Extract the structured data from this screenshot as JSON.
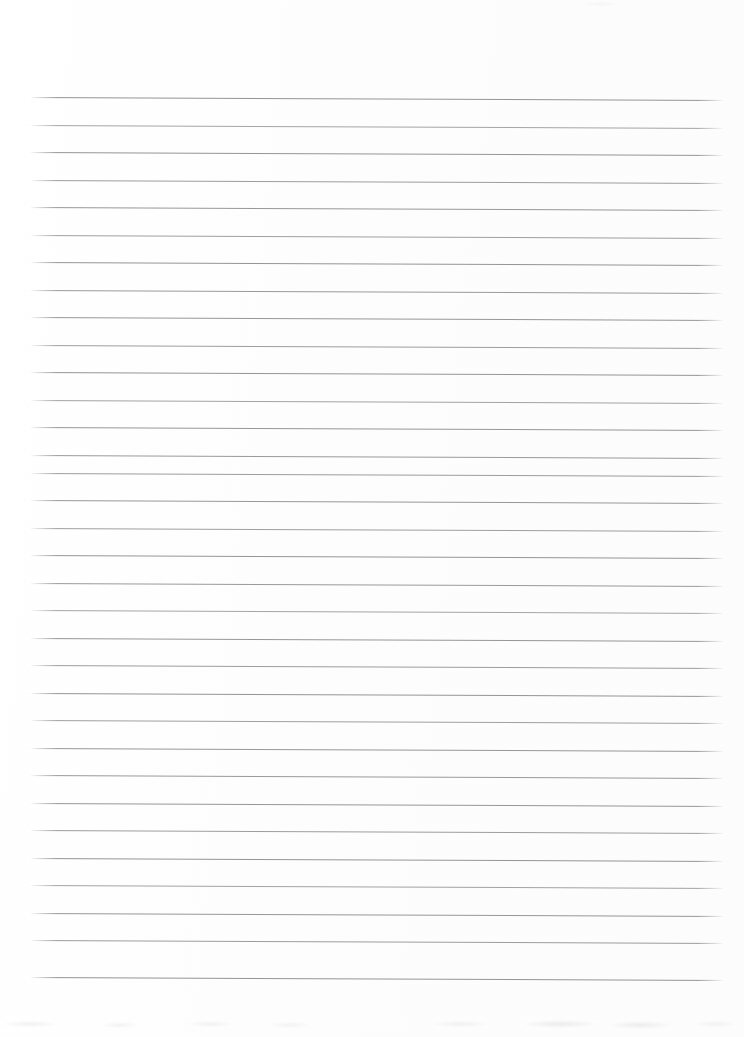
{
  "document": {
    "kind": "scanned-blank-ruled-page",
    "description": "Blank lined notebook paper scan with no handwriting or printed text",
    "page_width": 744,
    "page_height": 1037,
    "background_color": "#fdfdfd",
    "text_content": "",
    "visible_text": []
  },
  "ruling": {
    "line_color": "#8f8f8f",
    "line_thickness_px": 1,
    "line_count": 33,
    "first_line_y": 97,
    "line_spacing_px": 27.5,
    "left_x": 31,
    "right_x": 723,
    "tilt_px_over_page": 3,
    "lines": [
      {
        "y": 97,
        "x1": 31,
        "x2": 723,
        "opacity": 0.95
      },
      {
        "y": 125,
        "x1": 31,
        "x2": 723,
        "opacity": 0.8
      },
      {
        "y": 152,
        "x1": 31,
        "x2": 723,
        "opacity": 0.95
      },
      {
        "y": 180,
        "x1": 31,
        "x2": 723,
        "opacity": 0.88
      },
      {
        "y": 207,
        "x1": 31,
        "x2": 723,
        "opacity": 0.92
      },
      {
        "y": 235,
        "x1": 31,
        "x2": 723,
        "opacity": 0.85
      },
      {
        "y": 262,
        "x1": 31,
        "x2": 723,
        "opacity": 0.95
      },
      {
        "y": 290,
        "x1": 31,
        "x2": 723,
        "opacity": 0.9
      },
      {
        "y": 317,
        "x1": 31,
        "x2": 723,
        "opacity": 0.93
      },
      {
        "y": 345,
        "x1": 31,
        "x2": 723,
        "opacity": 0.87
      },
      {
        "y": 372,
        "x1": 31,
        "x2": 723,
        "opacity": 0.95
      },
      {
        "y": 400,
        "x1": 31,
        "x2": 723,
        "opacity": 0.82
      },
      {
        "y": 427,
        "x1": 31,
        "x2": 723,
        "opacity": 0.93
      },
      {
        "y": 455,
        "x1": 31,
        "x2": 723,
        "opacity": 0.9
      },
      {
        "y": 473,
        "x1": 31,
        "x2": 723,
        "opacity": 0.88
      },
      {
        "y": 500,
        "x1": 31,
        "x2": 723,
        "opacity": 0.92
      },
      {
        "y": 528,
        "x1": 31,
        "x2": 723,
        "opacity": 0.86
      },
      {
        "y": 555,
        "x1": 31,
        "x2": 723,
        "opacity": 0.94
      },
      {
        "y": 583,
        "x1": 31,
        "x2": 723,
        "opacity": 0.9
      },
      {
        "y": 610,
        "x1": 31,
        "x2": 723,
        "opacity": 0.8
      },
      {
        "y": 638,
        "x1": 31,
        "x2": 723,
        "opacity": 0.93
      },
      {
        "y": 665,
        "x1": 31,
        "x2": 723,
        "opacity": 0.88
      },
      {
        "y": 693,
        "x1": 31,
        "x2": 723,
        "opacity": 0.95
      },
      {
        "y": 720,
        "x1": 31,
        "x2": 723,
        "opacity": 0.85
      },
      {
        "y": 748,
        "x1": 31,
        "x2": 723,
        "opacity": 0.92
      },
      {
        "y": 775,
        "x1": 31,
        "x2": 723,
        "opacity": 0.9
      },
      {
        "y": 803,
        "x1": 31,
        "x2": 723,
        "opacity": 0.93
      },
      {
        "y": 830,
        "x1": 31,
        "x2": 723,
        "opacity": 0.87
      },
      {
        "y": 858,
        "x1": 31,
        "x2": 723,
        "opacity": 0.95
      },
      {
        "y": 885,
        "x1": 31,
        "x2": 723,
        "opacity": 0.82
      },
      {
        "y": 913,
        "x1": 31,
        "x2": 723,
        "opacity": 0.93
      },
      {
        "y": 940,
        "x1": 31,
        "x2": 723,
        "opacity": 0.88
      },
      {
        "y": 977,
        "x1": 31,
        "x2": 723,
        "opacity": 0.95
      }
    ]
  },
  "artifacts": {
    "line_break": {
      "x": 612,
      "y": 470,
      "width": 14,
      "height": 5
    },
    "bottom_smudge_band": {
      "y": 1012,
      "height": 25
    }
  }
}
